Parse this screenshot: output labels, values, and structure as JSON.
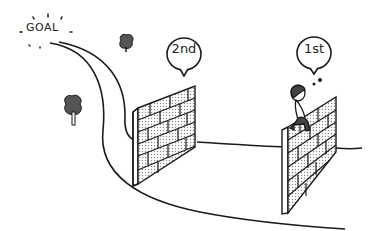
{
  "goal": {
    "label": "GOAL"
  },
  "bubbles": [
    {
      "label": "2nd",
      "type": "speech"
    },
    {
      "label": "1st",
      "type": "thought"
    }
  ],
  "colors": {
    "stroke": "#1a1a1a",
    "tree": "#555555",
    "brick_fill": "#d8d8d8",
    "person_dark": "#444444"
  }
}
